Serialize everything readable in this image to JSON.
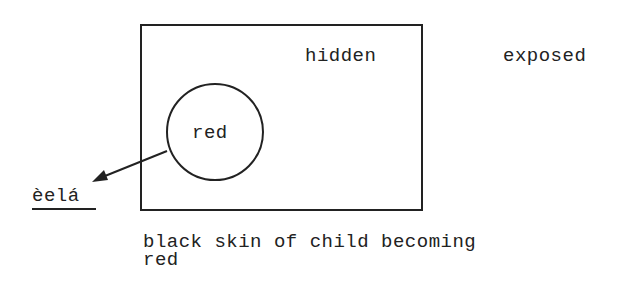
{
  "diagram": {
    "box_label": "hidden",
    "outside_label": "exposed",
    "circle_label": "red",
    "arrow_target_label": "èelá",
    "caption_line1": "black skin of child becoming",
    "caption_line2": "red"
  }
}
